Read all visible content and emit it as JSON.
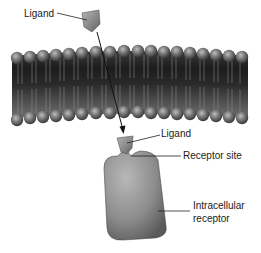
{
  "diagram": {
    "type": "cell-signaling",
    "labels": {
      "ligand_outside": "Ligand",
      "ligand_bound": "Ligand",
      "receptor_site": "Receptor site",
      "intracellular_receptor_line1": "Intracellular",
      "intracellular_receptor_line2": "receptor"
    },
    "components": [
      {
        "id": "ligand-extracellular",
        "shape": "pentagon",
        "color": "#8a8a8a"
      },
      {
        "id": "plasma-membrane",
        "shape": "phospholipid-bilayer",
        "head_color": "#7a7a7a",
        "core_color": "#2a2a2a"
      },
      {
        "id": "arrow",
        "from": "ligand-extracellular",
        "to": "ligand-bound"
      },
      {
        "id": "ligand-bound",
        "shape": "pentagon",
        "color": "#8a8a8a"
      },
      {
        "id": "intracellular-receptor",
        "shape": "rounded-rectangle-with-notch",
        "color": "#9a9a9a"
      }
    ]
  }
}
